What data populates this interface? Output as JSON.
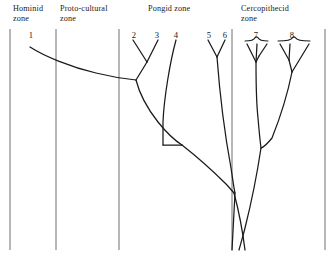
{
  "figure": {
    "kind": "phylogenetic-tree-diagram",
    "background_color": "#ffffff",
    "line_color": "#1a1a1a",
    "divider_color": "#555555",
    "zones": [
      {
        "id": "hominid",
        "label": "Hominid\nzone",
        "label_x": 13,
        "label_y": 4
      },
      {
        "id": "proto-cultural",
        "label": "Proto-cultural\nzone",
        "label_x": 60,
        "label_y": 4
      },
      {
        "id": "pongid",
        "label": "Pongid zone",
        "label_x": 148,
        "label_y": 4
      },
      {
        "id": "cercopithecid",
        "label": "Cercopithecid\nzone",
        "label_x": 241,
        "label_y": 4
      }
    ],
    "dividers": [
      {
        "id": "divider-left-border",
        "x": 10,
        "y1": 29,
        "y2": 250
      },
      {
        "id": "divider-hominid-proto",
        "x": 56,
        "y1": 29,
        "y2": 250
      },
      {
        "id": "divider-proto-pongid",
        "x": 119,
        "y1": 29,
        "y2": 250
      },
      {
        "id": "divider-pongid-cerco",
        "x": 232,
        "y1": 29,
        "y2": 250
      },
      {
        "id": "divider-right-border",
        "x": 325,
        "y1": 29,
        "y2": 250
      }
    ],
    "tip_numbers": [
      {
        "label": "1",
        "x": 31,
        "y": 30
      },
      {
        "label": "2",
        "x": 134,
        "y": 30
      },
      {
        "label": "3",
        "x": 157,
        "y": 30
      },
      {
        "label": "4",
        "x": 176,
        "y": 30
      },
      {
        "label": "5",
        "x": 209,
        "y": 30
      },
      {
        "label": "6",
        "x": 225,
        "y": 30
      },
      {
        "label": "7",
        "x": 256,
        "y": 30
      },
      {
        "label": "8",
        "x": 292,
        "y": 30
      }
    ],
    "braces": [
      {
        "id": "brace-group-7",
        "x_left": 245,
        "x_right": 268,
        "y": 41
      },
      {
        "id": "brace-group-8",
        "x_left": 278,
        "x_right": 310,
        "y": 41
      }
    ],
    "branches": [
      {
        "id": "branch-hominid-1",
        "path": "M 30 47 C 44 56 70 67 96 73 C 112 77 126 79 136 80"
      },
      {
        "id": "branch-tip-2",
        "path": "M 133 40 L 147 62"
      },
      {
        "id": "branch-tip-3",
        "path": "M 158 40 L 147 62"
      },
      {
        "id": "branch-node-23-to-main",
        "path": "M 147 62 L 136 80"
      },
      {
        "id": "branch-main-node-to-trunk",
        "path": "M 136 80 C 139 92 147 108 158 122 C 166 132 174 140 182 145"
      },
      {
        "id": "branch-tip-4",
        "path": "M 176 40 C 170 62 164 98 163 122 C 163 132 163 140 163 145"
      },
      {
        "id": "branch-node4-join",
        "path": "M 163 145 L 182 145"
      },
      {
        "id": "branch-trunk-lower",
        "path": "M 182 145 C 196 156 214 172 226 184 C 230 188 232 191 234 193"
      },
      {
        "id": "branch-tip-5",
        "path": "M 208 40 L 217 57"
      },
      {
        "id": "branch-tip-6",
        "path": "M 225 40 L 217 57"
      },
      {
        "id": "branch-node-56-down",
        "path": "M 217 57 C 219 84 224 130 231 168 C 233 181 234 189 235 193"
      },
      {
        "id": "branch-trunk-crossing-down",
        "path": "M 234 193 C 238 208 242 226 245 250"
      },
      {
        "id": "branch-root-stem",
        "path": "M 235 193 C 234 210 233 230 232 250"
      },
      {
        "id": "branch-cerco-7-tip-a",
        "path": "M 247 44 L 256 62"
      },
      {
        "id": "branch-cerco-7-tip-b",
        "path": "M 257 44 L 256 62"
      },
      {
        "id": "branch-cerco-7-tip-c",
        "path": "M 267 44 L 259 56"
      },
      {
        "id": "branch-cerco-7-node",
        "path": "M 256 62 L 259 56"
      },
      {
        "id": "branch-cerco-7-stem",
        "path": "M 256 62 C 256 78 256 100 258 118 C 259 130 260 140 261 148"
      },
      {
        "id": "branch-cerco-8-tip-a",
        "path": "M 280 44 L 289 60"
      },
      {
        "id": "branch-cerco-8-tip-b",
        "path": "M 290 44 L 289 60"
      },
      {
        "id": "branch-cerco-8-tip-c",
        "path": "M 309 44 L 292 72"
      },
      {
        "id": "branch-cerco-8-node",
        "path": "M 289 60 C 290 64 291 68 292 72"
      },
      {
        "id": "branch-cerco-8-stem",
        "path": "M 292 72 C 288 92 280 118 272 138 C 268 143 264 147 261 148"
      },
      {
        "id": "branch-cerco-root",
        "path": "M 261 148 C 258 168 252 200 245 228 C 242 240 240 246 239 250"
      }
    ]
  }
}
